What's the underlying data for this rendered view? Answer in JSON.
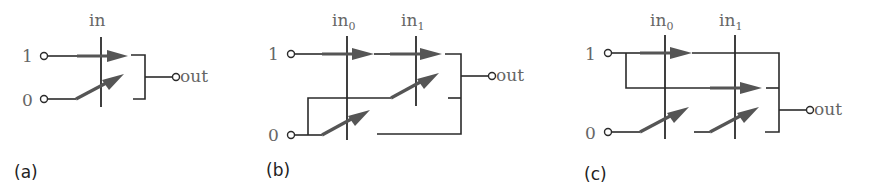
{
  "figure": {
    "panels": [
      {
        "caption": "(a)",
        "control_labels": [
          {
            "base": "in",
            "sub": ""
          }
        ],
        "input_labels": [
          "1",
          "0"
        ],
        "output_label": "out"
      },
      {
        "caption": "(b)",
        "control_labels": [
          {
            "base": "in",
            "sub": "0"
          },
          {
            "base": "in",
            "sub": "1"
          }
        ],
        "input_labels": [
          "1",
          "0"
        ],
        "output_label": "out"
      },
      {
        "caption": "(c)",
        "control_labels": [
          {
            "base": "in",
            "sub": "0"
          },
          {
            "base": "in",
            "sub": "1"
          }
        ],
        "input_labels": [
          "1",
          "0"
        ],
        "output_label": "out"
      }
    ],
    "colors": {
      "wire": "#2b2b2b",
      "switch_arm": "#555555",
      "label": "#666666",
      "caption": "#222222"
    }
  }
}
